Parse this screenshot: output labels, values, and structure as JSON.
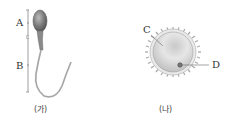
{
  "figure_a": {
    "caption": "(가)",
    "subject": "sperm",
    "labels": {
      "A": "A",
      "B": "B"
    }
  },
  "figure_b": {
    "caption": "(나)",
    "subject": "egg",
    "labels": {
      "C": "C",
      "D": "D"
    }
  }
}
